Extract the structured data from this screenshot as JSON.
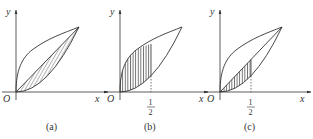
{
  "figure": {
    "panels": [
      {
        "id": "a",
        "caption": "(a)",
        "origin_label": "O",
        "x_label": "x",
        "y_label": "y",
        "shaded_region": "between line y=x and curve y=x^2, 0<=x<=1",
        "tick_label": null
      },
      {
        "id": "b",
        "caption": "(b)",
        "origin_label": "O",
        "x_label": "x",
        "y_label": "y",
        "shaded_region": "between curve y=sqrt(x) and curve y=x^2, 0<=x<=1/2",
        "tick_label": {
          "numerator": "1",
          "denominator": "2"
        }
      },
      {
        "id": "c",
        "caption": "(c)",
        "origin_label": "O",
        "x_label": "x",
        "y_label": "y",
        "shaded_region": "between line y=x and curve y=x^2, 0<=x<=1/2",
        "tick_label": {
          "numerator": "1",
          "denominator": "2"
        }
      }
    ],
    "colors": {
      "stroke": "#333333",
      "hatch": "#444444",
      "background": "#ffffff"
    }
  }
}
